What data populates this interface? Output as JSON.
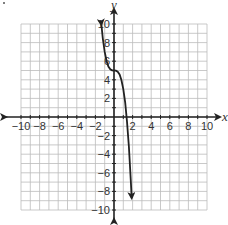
{
  "chart_data": {
    "type": "line",
    "title": "",
    "xlabel": "x",
    "ylabel": "y",
    "xlim": [
      -10,
      10
    ],
    "ylim": [
      -10,
      10
    ],
    "grid": true,
    "grid_step": 1,
    "x_ticks": [
      -10,
      -8,
      -6,
      -4,
      -2,
      2,
      4,
      6,
      8,
      10
    ],
    "y_ticks": [
      -10,
      -8,
      -6,
      -4,
      -2,
      2,
      4,
      6,
      8,
      10
    ],
    "x_tick_labels": [
      "−10",
      "−8",
      "−6",
      "−4",
      "−2",
      "2",
      "4",
      "6",
      "8",
      "10"
    ],
    "y_tick_labels": [
      "−10",
      "−8",
      "−6",
      "−4",
      "−2",
      "2",
      "4",
      "6",
      "8",
      "10"
    ],
    "series": [
      {
        "name": "curve",
        "function": "y = -2x^3 + 5",
        "x": [
          -1.35,
          -1.2,
          -1.0,
          -0.8,
          -0.6,
          -0.4,
          -0.2,
          0.0,
          0.2,
          0.4,
          0.6,
          0.8,
          1.0,
          1.2,
          1.4,
          1.6,
          1.8,
          1.9
        ],
        "y": [
          9.92,
          8.46,
          7.0,
          6.02,
          5.43,
          5.13,
          5.02,
          5.0,
          4.98,
          4.87,
          4.57,
          3.98,
          3.0,
          1.54,
          -0.49,
          -3.19,
          -6.66,
          -8.72
        ],
        "arrows_at_ends": true,
        "color": "#222222"
      }
    ],
    "legend": null
  },
  "colors": {
    "grid": "#bbbbbb",
    "axis": "#222222",
    "curve": "#222222",
    "text": "#333333"
  }
}
